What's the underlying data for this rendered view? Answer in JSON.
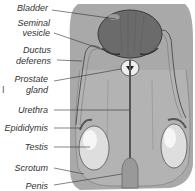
{
  "diagram": {
    "colors": {
      "background_body": "#a8a8a8",
      "bladder": "#6a6a6a",
      "testis": "#dcdcdc",
      "lines": "#333333",
      "text": "#333333"
    },
    "labels": [
      {
        "id": "bladder",
        "text": "Bladder"
      },
      {
        "id": "seminal_vesicle_1",
        "text": "Seminal"
      },
      {
        "id": "seminal_vesicle_2",
        "text": "vesicle"
      },
      {
        "id": "ductus_deferens_1",
        "text": "Ductus"
      },
      {
        "id": "ductus_deferens_2",
        "text": "deferens"
      },
      {
        "id": "prostate_gland_1",
        "text": "Prostate"
      },
      {
        "id": "prostate_gland_2",
        "text": "gland"
      },
      {
        "id": "urethra",
        "text": "Urethra"
      },
      {
        "id": "epididymis",
        "text": "Epididymis"
      },
      {
        "id": "testis",
        "text": "Testis"
      },
      {
        "id": "scrotum",
        "text": "Scrotum"
      },
      {
        "id": "penis",
        "text": "Penis"
      }
    ],
    "side_mark": "I"
  }
}
